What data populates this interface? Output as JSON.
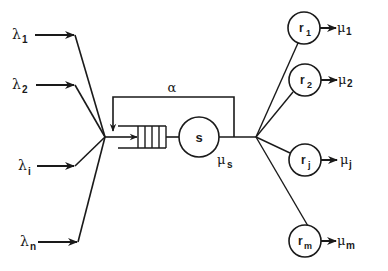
{
  "diagram": {
    "type": "queueing-network",
    "inputs": [
      {
        "symbol": "λ",
        "sub": "1",
        "y": 35
      },
      {
        "symbol": "λ",
        "sub": "2",
        "y": 85
      },
      {
        "symbol": "λ",
        "sub": "i",
        "y": 166
      },
      {
        "symbol": "λ",
        "sub": "n",
        "y": 242
      }
    ],
    "queue": {
      "slots": 4
    },
    "server": {
      "label": "s",
      "rate_symbol": "μ",
      "rate_sub": "s"
    },
    "feedback": {
      "label": "α"
    },
    "outputs": [
      {
        "label": "r",
        "label_sub": "1",
        "rate_symbol": "μ",
        "rate_sub": "1",
        "cy": 28
      },
      {
        "label": "r",
        "label_sub": "2",
        "rate_symbol": "μ",
        "rate_sub": "2",
        "cy": 80
      },
      {
        "label": "r",
        "label_sub": "j",
        "rate_symbol": "μ",
        "rate_sub": "j",
        "cy": 160
      },
      {
        "label": "r",
        "label_sub": "m",
        "rate_symbol": "μ",
        "rate_sub": "m",
        "cy": 241
      }
    ]
  }
}
